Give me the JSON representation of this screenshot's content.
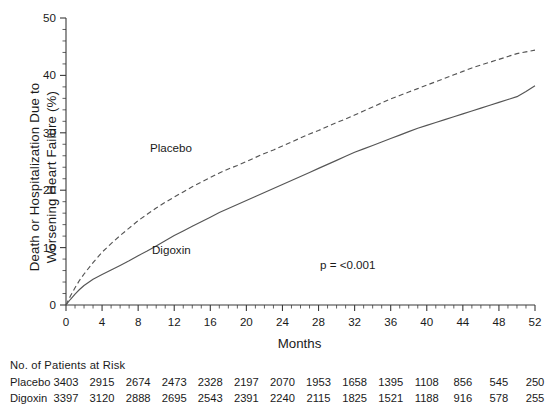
{
  "chart_data": {
    "type": "line",
    "title": "",
    "xlabel": "Months",
    "ylabel_line1": "Death or Hospitalization Due to",
    "ylabel_line2": "Worsening Heart Failure (%)",
    "xlim": [
      0,
      52
    ],
    "ylim": [
      0,
      50
    ],
    "xticks": [
      0,
      4,
      8,
      12,
      16,
      20,
      24,
      28,
      32,
      36,
      40,
      44,
      48,
      52
    ],
    "xtick_labels": [
      "0",
      "4",
      "8",
      "12",
      "16",
      "20",
      "24",
      "28",
      "32",
      "36",
      "40",
      "44",
      "48",
      "52"
    ],
    "x_minor_tick_interval": 1,
    "yticks": [
      0,
      10,
      20,
      30,
      40,
      50
    ],
    "ytick_labels": [
      "0",
      "10",
      "20",
      "30",
      "40",
      "50"
    ],
    "y_minor_tick_interval": 2,
    "grid": false,
    "legend_position": "inline-annotations",
    "annotations": [
      {
        "name": "placebo-curve-label",
        "text": "Placebo",
        "x": 15.0,
        "y": 27.0
      },
      {
        "name": "digoxin-curve-label",
        "text": "Digoxin",
        "x": 15.4,
        "y": 10.8
      },
      {
        "name": "p-value",
        "text": "p  =  <0.001",
        "x": 44.5,
        "y": 8.2
      }
    ],
    "series": [
      {
        "name": "Placebo",
        "style": "dashed",
        "color": "#555555",
        "x": [
          0,
          0.5,
          1,
          1.5,
          2,
          3,
          4,
          5,
          6,
          7,
          8,
          9,
          10,
          11,
          12,
          13,
          14,
          15,
          16,
          17,
          18,
          19,
          20,
          21,
          22,
          23,
          24,
          25,
          26,
          27,
          28,
          29,
          30,
          31,
          32,
          33,
          34,
          35,
          36,
          37,
          38,
          39,
          40,
          41,
          42,
          43,
          44,
          45,
          46,
          47,
          48,
          49,
          50,
          51,
          52
        ],
        "y": [
          0,
          1.6,
          3.0,
          4.3,
          5.4,
          7.4,
          9.2,
          10.7,
          12.1,
          13.4,
          14.7,
          15.8,
          16.9,
          17.9,
          18.8,
          19.7,
          20.6,
          21.4,
          22.2,
          23.0,
          23.7,
          24.3,
          25.0,
          25.7,
          26.4,
          27.0,
          27.7,
          28.4,
          29.1,
          29.8,
          30.4,
          31.1,
          31.8,
          32.4,
          33.1,
          33.8,
          34.5,
          35.2,
          35.9,
          36.5,
          37.1,
          37.7,
          38.3,
          38.9,
          39.5,
          40.1,
          40.7,
          41.3,
          41.8,
          42.3,
          42.8,
          43.3,
          43.8,
          44.1,
          44.4
        ]
      },
      {
        "name": "Digoxin",
        "style": "solid",
        "color": "#555555",
        "x": [
          0,
          0.5,
          1,
          1.5,
          2,
          3,
          4,
          5,
          6,
          7,
          8,
          9,
          10,
          11,
          12,
          13,
          14,
          15,
          16,
          17,
          18,
          19,
          20,
          21,
          22,
          23,
          24,
          25,
          26,
          27,
          28,
          29,
          30,
          31,
          32,
          33,
          34,
          35,
          36,
          37,
          38,
          39,
          40,
          41,
          42,
          43,
          44,
          45,
          46,
          47,
          48,
          49,
          50,
          51,
          52
        ],
        "y": [
          0,
          1.0,
          1.9,
          2.7,
          3.4,
          4.5,
          5.3,
          6.1,
          6.9,
          7.7,
          8.6,
          9.4,
          10.3,
          11.2,
          12.1,
          12.9,
          13.7,
          14.5,
          15.3,
          16.1,
          16.8,
          17.5,
          18.2,
          18.9,
          19.6,
          20.3,
          21.0,
          21.7,
          22.4,
          23.1,
          23.8,
          24.5,
          25.2,
          25.9,
          26.6,
          27.2,
          27.8,
          28.4,
          29.0,
          29.6,
          30.2,
          30.8,
          31.3,
          31.8,
          32.3,
          32.8,
          33.3,
          33.8,
          34.3,
          34.8,
          35.3,
          35.8,
          36.3,
          37.2,
          38.2
        ]
      }
    ]
  },
  "risk_table": {
    "title": "No. of Patients at Risk",
    "columns": [
      0,
      4,
      8,
      12,
      16,
      20,
      24,
      28,
      32,
      36,
      40,
      44,
      48,
      52
    ],
    "rows": [
      {
        "name": "Placebo",
        "values": [
          "3403",
          "2915",
          "2674",
          "2473",
          "2328",
          "2197",
          "2070",
          "1953",
          "1658",
          "1395",
          "1108",
          "856",
          "545",
          "250"
        ]
      },
      {
        "name": "Digoxin",
        "values": [
          "3397",
          "3120",
          "2888",
          "2695",
          "2543",
          "2391",
          "2240",
          "2115",
          "1825",
          "1521",
          "1188",
          "916",
          "578",
          "255"
        ]
      }
    ]
  },
  "colors": {
    "axis": "#3a3a3a",
    "curve": "#555555",
    "text": "#1a1a1a",
    "background": "#ffffff"
  }
}
